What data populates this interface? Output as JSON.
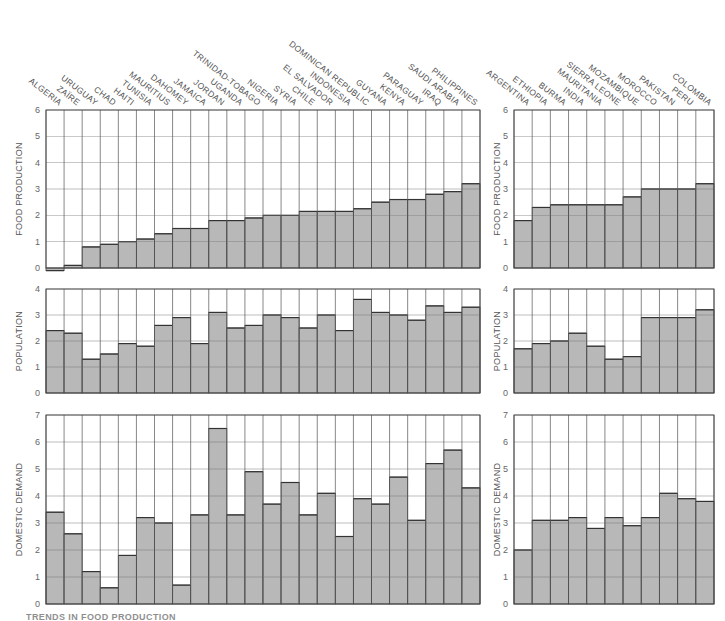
{
  "caption": "TRENDS IN FOOD PRODUCTION",
  "chart_data": [
    {
      "type": "bar",
      "panel": "left",
      "title": "",
      "categories": [
        "ALGERIA",
        "ZAÏRE",
        "URUGUAY",
        "CHAD",
        "HAITI",
        "TUNISIA",
        "MAURITIUS",
        "DAHOMEY",
        "JAMAICA",
        "JORDAN",
        "UGANDA",
        "TRINIDAD-TOBAGO",
        "NIGERIA",
        "SYRIA",
        "CHILE",
        "EL SALVADOR",
        "INDONESIA",
        "DOMINICAN REPUBLIC",
        "GUYANA",
        "KENYA",
        "PARAGUAY",
        "IRAQ",
        "SAUDI ARABIA",
        "PHILIPPINES"
      ],
      "series": [
        {
          "name": "FOOD PRODUCTION",
          "ylim": [
            0,
            6
          ],
          "values": [
            -0.1,
            0.1,
            0.8,
            0.9,
            1.0,
            1.1,
            1.3,
            1.5,
            1.5,
            1.8,
            1.8,
            1.9,
            2.0,
            2.0,
            2.15,
            2.15,
            2.15,
            2.25,
            2.5,
            2.6,
            2.6,
            2.8,
            2.9,
            3.2
          ]
        },
        {
          "name": "POPULATION",
          "ylim": [
            0,
            4
          ],
          "values": [
            2.4,
            2.3,
            1.3,
            1.5,
            1.9,
            1.8,
            2.6,
            2.9,
            1.9,
            3.1,
            2.5,
            2.6,
            3.0,
            2.9,
            2.5,
            3.0,
            2.4,
            3.6,
            3.1,
            3.0,
            2.8,
            3.35,
            3.1,
            3.3
          ]
        },
        {
          "name": "DOMESTIC DEMAND",
          "ylim": [
            0,
            7
          ],
          "values": [
            3.4,
            2.6,
            1.2,
            0.6,
            1.8,
            3.2,
            3.0,
            0.7,
            3.3,
            6.5,
            3.3,
            4.9,
            3.7,
            4.5,
            3.3,
            4.1,
            2.5,
            3.9,
            3.7,
            4.7,
            3.1,
            5.2,
            5.7,
            4.3
          ]
        }
      ],
      "xlabel": "",
      "grid": true
    },
    {
      "type": "bar",
      "panel": "right",
      "title": "",
      "categories": [
        "ARGENTINA",
        "ETHIOPIA",
        "BURMA",
        "INDIA",
        "MAURITANIA",
        "SIERRA LEONE",
        "MOZAMBIQUE",
        "MOROCCO",
        "PAKISTAN",
        "PERU",
        "COLOMBIA"
      ],
      "series": [
        {
          "name": "FOOD PRODUCTION",
          "ylim": [
            0,
            6
          ],
          "values": [
            1.8,
            2.3,
            2.4,
            2.4,
            2.4,
            2.4,
            2.7,
            3.0,
            3.0,
            3.0,
            3.2
          ]
        },
        {
          "name": "POPULATION",
          "ylim": [
            0,
            4
          ],
          "values": [
            1.7,
            1.9,
            2.0,
            2.3,
            1.8,
            1.3,
            1.4,
            2.9,
            2.9,
            2.9,
            3.2
          ]
        },
        {
          "name": "DOMESTIC DEMAND",
          "ylim": [
            0,
            7
          ],
          "values": [
            2.0,
            3.1,
            3.1,
            3.2,
            2.8,
            3.2,
            2.9,
            3.2,
            4.1,
            3.9,
            3.8
          ]
        }
      ],
      "xlabel": "",
      "grid": true
    }
  ]
}
